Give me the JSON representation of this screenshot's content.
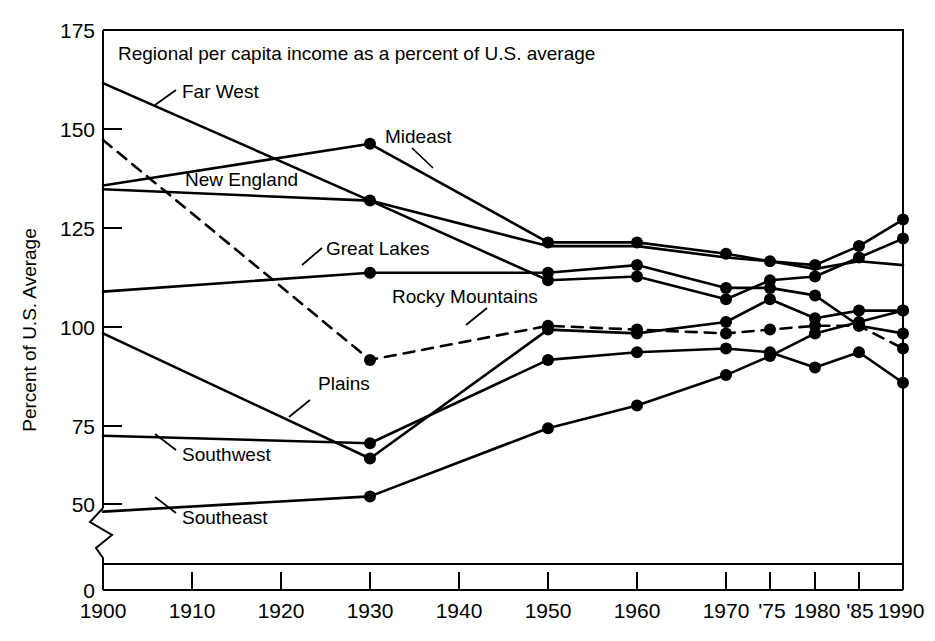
{
  "chart_data": {
    "type": "line",
    "title": "Regional per capita income as a percent of U.S. average",
    "xlabel": "",
    "ylabel": "Percent of U.S. Average",
    "x": [
      1900,
      1930,
      1950,
      1960,
      1970,
      1975,
      1980,
      1985,
      1990
    ],
    "xtick_labels": [
      "1900",
      "1910",
      "1920",
      "1930",
      "1940",
      "1950",
      "1960",
      "1970",
      "'75",
      "1980",
      "'85",
      "1990"
    ],
    "xtick_values": [
      1900,
      1910,
      1920,
      1930,
      1940,
      1950,
      1960,
      1970,
      1975,
      1980,
      1985,
      1990
    ],
    "ytick_labels": [
      "0",
      "50",
      "75",
      "100",
      "125",
      "150",
      "175"
    ],
    "ytick_values": [
      0,
      50,
      75,
      100,
      125,
      150,
      175
    ],
    "ylim": [
      50,
      175
    ],
    "xlim": [
      1900,
      1990
    ],
    "axis_break": true,
    "axis_break_note": "y-axis broken between 0 and 50",
    "grid": false,
    "legend": "inline-labels",
    "series": [
      {
        "name": "Far West",
        "style": "solid",
        "markers": false,
        "values": [
          161,
          130,
          118,
          118,
          115,
          114,
          112,
          114,
          113
        ],
        "label_anchor": {
          "x": 182,
          "y": 97
        }
      },
      {
        "name": "Mideast",
        "style": "solid",
        "markers": true,
        "values": [
          134,
          145,
          119,
          119,
          116,
          114,
          113,
          118,
          125
        ],
        "label_anchor": {
          "x": 385,
          "y": 142
        }
      },
      {
        "name": "New England",
        "style": "solid",
        "markers": true,
        "values": [
          133,
          130,
          109,
          110,
          104,
          109,
          110,
          115,
          120
        ],
        "label_anchor": {
          "x": 185,
          "y": 184
        }
      },
      {
        "name": "Great Lakes",
        "style": "solid",
        "markers": true,
        "values": [
          106,
          111,
          111,
          113,
          107,
          107,
          105,
          97,
          95
        ],
        "label_anchor": {
          "x": 325,
          "y": 253
        }
      },
      {
        "name": "Rocky Mountains",
        "style": "dashed",
        "markers": true,
        "values": [
          146,
          88,
          97,
          96,
          95,
          96,
          97,
          97,
          91
        ],
        "label_anchor": {
          "x": 392,
          "y": 301
        }
      },
      {
        "name": "Plains",
        "style": "solid",
        "markers": true,
        "values": [
          95,
          62,
          96,
          95,
          98,
          104,
          99,
          101,
          101
        ]
      },
      {
        "name": "Southwest",
        "style": "solid",
        "markers": true,
        "values": [
          68,
          66,
          88,
          90,
          91,
          90,
          86,
          90,
          82
        ],
        "label_anchor": {
          "x": 183,
          "y": 456
        }
      },
      {
        "name": "Southeast",
        "style": "solid",
        "markers": true,
        "values": [
          48,
          52,
          70,
          76,
          84,
          89,
          95,
          98,
          101
        ],
        "label_anchor": {
          "x": 183,
          "y": 519
        }
      }
    ],
    "series_label_texts": [
      "Far West",
      "Mideast",
      "New England",
      "Great Lakes",
      "Rocky Mountains",
      "Plains",
      "Southwest",
      "Southeast"
    ],
    "plains_label": "Plains"
  }
}
